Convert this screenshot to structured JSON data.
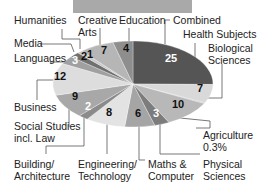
{
  "header_bar": {
    "color": "#a9a9a9"
  },
  "chart_data": {
    "type": "pie",
    "title": "",
    "unit": "%",
    "segments": [
      {
        "name": "Combined",
        "value": 0,
        "label": "",
        "color": "#555555",
        "label_color": "#222"
      },
      {
        "name": "Health Subjects",
        "value": 25,
        "label": "25",
        "color": "#555555",
        "label_color": "#ffffff"
      },
      {
        "name": "Biological Sciences",
        "value": 7,
        "label": "7",
        "color": "#d8d8d8",
        "label_color": "#111"
      },
      {
        "name": "Agriculture",
        "value": 0.3,
        "label": "0.3%",
        "color": "#bbbbbb",
        "label_color": "#111"
      },
      {
        "name": "Physical Sciences",
        "value": 10,
        "label": "10",
        "color": "#b9b9b9",
        "label_color": "#111"
      },
      {
        "name": "Maths & Computer",
        "value": 3,
        "label": "3",
        "color": "#7a7a7a",
        "label_color": "#ffffff"
      },
      {
        "name": "Engineering/ Technology",
        "value": 6,
        "label": "6",
        "color": "#a3a3a3",
        "label_color": "#111"
      },
      {
        "name": "Building/ Architecture",
        "value": 8,
        "label": "8",
        "color": "#e2e2e2",
        "label_color": "#111"
      },
      {
        "name": "Social Studies incl. Law",
        "value": 2,
        "label": "2",
        "color": "#8a8a8a",
        "label_color": "#ffffff"
      },
      {
        "name": "Business",
        "value": 9,
        "label": "9",
        "color": "#a6a6a6",
        "label_color": "#111"
      },
      {
        "name": "Languages",
        "value": 12,
        "label": "12",
        "color": "#dcdcdc",
        "label_color": "#111"
      },
      {
        "name": "Media",
        "value": 3,
        "label": "3",
        "color": "#9a9a9a",
        "label_color": "#ffffff"
      },
      {
        "name": "Humanities",
        "value": 2,
        "label": "2",
        "color": "#6e6e6e",
        "label_color": "#111"
      },
      {
        "name": "Creative Arts",
        "value": 1,
        "label": "1",
        "color": "#c4c4c4",
        "label_color": "#111"
      },
      {
        "name": "Creative Arts (main)",
        "value": 7,
        "label": "7",
        "color": "#b5b5b5",
        "label_color": "#111"
      },
      {
        "name": "Education",
        "value": 4,
        "label": "4",
        "color": "#8c8c8c",
        "label_color": "#111"
      }
    ],
    "category_labels": [
      {
        "text": [
          "Humanities"
        ],
        "x": 14,
        "y": 24
      },
      {
        "text": [
          "Creative",
          "Arts"
        ],
        "x": 78,
        "y": 24
      },
      {
        "text": [
          "Education"
        ],
        "x": 119,
        "y": 24
      },
      {
        "text": [
          "Combined"
        ],
        "x": 173,
        "y": 24
      },
      {
        "text": [
          "Health Subjects"
        ],
        "x": 183,
        "y": 38
      },
      {
        "text": [
          "Media"
        ],
        "x": 14,
        "y": 47
      },
      {
        "text": [
          "Biological",
          "Sciences"
        ],
        "x": 208,
        "y": 52
      },
      {
        "text": [
          "Languages"
        ],
        "x": 14,
        "y": 62
      },
      {
        "text": [
          "Business"
        ],
        "x": 14,
        "y": 111
      },
      {
        "text": [
          "Social Studies",
          "incl. Law"
        ],
        "x": 14,
        "y": 130
      },
      {
        "text": [
          "Agriculture",
          "0.3%"
        ],
        "x": 203,
        "y": 139
      },
      {
        "text": [
          "Building/",
          "Architecture"
        ],
        "x": 14,
        "y": 168
      },
      {
        "text": [
          "Engineering/",
          "Technology"
        ],
        "x": 78,
        "y": 168
      },
      {
        "text": [
          "Maths &",
          "Computer"
        ],
        "x": 148,
        "y": 168
      },
      {
        "text": [
          "Physical",
          "Sciences"
        ],
        "x": 203,
        "y": 168
      }
    ],
    "value_labels": [
      {
        "text": "25",
        "x": 171,
        "y": 62,
        "color": "#ffffff"
      },
      {
        "text": "7",
        "x": 200,
        "y": 92,
        "color": "#111"
      },
      {
        "text": "10",
        "x": 178,
        "y": 108,
        "color": "#111"
      },
      {
        "text": "3",
        "x": 156,
        "y": 117,
        "color": "#ffffff"
      },
      {
        "text": "6",
        "x": 138,
        "y": 117,
        "color": "#111"
      },
      {
        "text": "8",
        "x": 109,
        "y": 116,
        "color": "#111"
      },
      {
        "text": "2",
        "x": 88,
        "y": 110,
        "color": "#ffffff"
      },
      {
        "text": "9",
        "x": 75,
        "y": 100,
        "color": "#111"
      },
      {
        "text": "12",
        "x": 60,
        "y": 80,
        "color": "#111"
      },
      {
        "text": "3",
        "x": 75,
        "y": 64,
        "color": "#ffffff"
      },
      {
        "text": "2",
        "x": 84,
        "y": 60,
        "color": "#111"
      },
      {
        "text": "1",
        "x": 90,
        "y": 58,
        "color": "#111"
      },
      {
        "text": "7",
        "x": 104,
        "y": 54,
        "color": "#111"
      },
      {
        "text": "4",
        "x": 126,
        "y": 52,
        "color": "#111"
      }
    ],
    "legend": "none"
  }
}
